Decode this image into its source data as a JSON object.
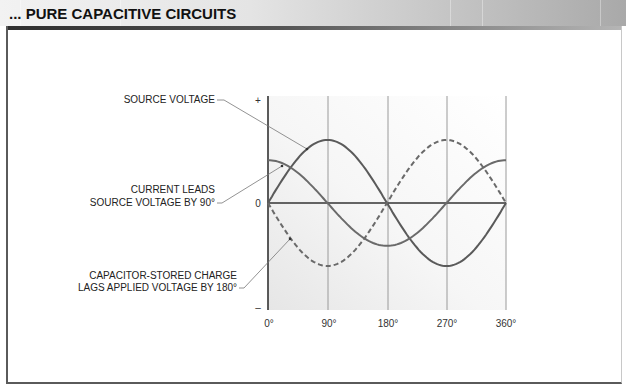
{
  "header": {
    "title": "... PURE CAPACITIVE CIRCUITS"
  },
  "annotations": {
    "source_voltage": "SOURCE VOLTAGE",
    "current_line1": "CURRENT LEADS",
    "current_line2": "SOURCE VOLTAGE BY 90°",
    "charge_line1": "CAPACITOR-STORED CHARGE",
    "charge_line2": "LAGS APPLIED VOLTAGE BY 180°"
  },
  "axis": {
    "y_plus": "+",
    "y_zero": "0",
    "y_minus": "–",
    "x_ticks": [
      "0°",
      "90°",
      "180°",
      "270°",
      "360°"
    ]
  },
  "colors": {
    "curve": "#5a5a5a",
    "grid": "#9a9a9a",
    "axis": "#333333",
    "leader": "#777777"
  },
  "chart_data": {
    "type": "line",
    "title": "Pure Capacitive Circuits",
    "xlabel": "Phase angle (degrees)",
    "ylabel": "",
    "x": [
      0,
      90,
      180,
      270,
      360
    ],
    "xlim": [
      0,
      360
    ],
    "ylim": [
      -1,
      1
    ],
    "grid": true,
    "series": [
      {
        "name": "Source voltage",
        "style": "solid",
        "amplitude": 1.0,
        "phase_deg": 0,
        "values": [
          0,
          1,
          0,
          -1,
          0
        ]
      },
      {
        "name": "Current (leads source voltage by 90°)",
        "style": "solid",
        "amplitude": 0.68,
        "phase_deg": 90,
        "values": [
          0.68,
          0,
          -0.68,
          0,
          0.68
        ]
      },
      {
        "name": "Capacitor-stored charge (lags applied voltage by 180°)",
        "style": "dashed",
        "amplitude": 1.0,
        "phase_deg": 180,
        "values": [
          0,
          -1,
          0,
          1,
          0
        ]
      }
    ]
  }
}
